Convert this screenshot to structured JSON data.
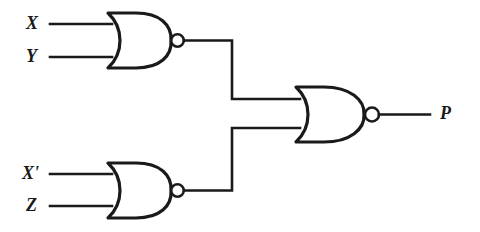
{
  "diagram": {
    "background_color": "#ffffff",
    "line_color": "#1a1a1a"
  },
  "inputs": [
    {
      "id": "x",
      "label": "X",
      "y": 24
    },
    {
      "id": "y",
      "label": "Y",
      "y": 57
    },
    {
      "id": "x-prime",
      "label": "X'",
      "y": 174
    },
    {
      "id": "z",
      "label": "Z",
      "y": 206
    }
  ],
  "outputs": [
    {
      "id": "p",
      "label": "P",
      "y": 114
    }
  ],
  "gates": [
    {
      "id": "gate-top",
      "type": "NOR",
      "inputs": [
        "X",
        "Y"
      ],
      "output_bubble": true
    },
    {
      "id": "gate-bottom",
      "type": "NOR",
      "inputs": [
        "X'",
        "Z"
      ],
      "output_bubble": true
    },
    {
      "id": "gate-output",
      "type": "NOR",
      "inputs": [
        "gate-top",
        "gate-bottom"
      ],
      "output_bubble": true,
      "output_label": "P"
    }
  ]
}
